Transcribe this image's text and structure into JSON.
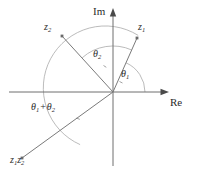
{
  "figure": {
    "background_color": "#ffffff",
    "axis_color": "#6f6f6f",
    "vector_color": "#7a7a7a",
    "arc_color": "#a9a9a9",
    "text_color": "#2b2b2b"
  },
  "axes": {
    "imaginary": {
      "label": "Im",
      "orientation": "vertical",
      "arrow": "up"
    },
    "real": {
      "label": "Re",
      "orientation": "horizontal",
      "arrow": "right"
    },
    "origin": {
      "x": 113,
      "y": 92
    }
  },
  "vectors": [
    {
      "id": "z1",
      "label_main": "z",
      "label_sub": "1",
      "tip": {
        "x": 137,
        "y": 38
      },
      "angle_degrees": 66,
      "label_pos": {
        "x": 139,
        "y": 24
      }
    },
    {
      "id": "z2",
      "label_main": "z",
      "label_sub": "2",
      "tip": {
        "x": 62,
        "y": 36
      },
      "angle_degrees": 132,
      "label_pos": {
        "x": 45,
        "y": 24
      }
    },
    {
      "id": "z1z2",
      "label_main": "z",
      "label_sub": "1",
      "label_main2": "z",
      "label_sub2": "2",
      "tip": {
        "x": 22,
        "y": 158
      },
      "angle_degrees": 238,
      "label_pos": {
        "x": 11,
        "y": 158
      }
    }
  ],
  "angles": [
    {
      "id": "theta1",
      "label_main": "θ",
      "label_sub": "1",
      "radius": 32,
      "from_degrees": 0,
      "to_degrees": 66,
      "label_pos": {
        "x": 122,
        "y": 70
      }
    },
    {
      "id": "theta2",
      "label_main": "θ",
      "label_sub": "2",
      "radius": 46,
      "from_degrees": 66,
      "to_degrees": 132,
      "label_pos": {
        "x": 93,
        "y": 50
      }
    },
    {
      "id": "theta1-plus-theta2",
      "label_main": "θ",
      "label_sub": "1",
      "plus": "+",
      "label_main2": "θ",
      "label_sub2": "2",
      "radius": 62,
      "from_degrees": 66,
      "to_degrees": 238,
      "label_pos": {
        "x": 31,
        "y": 103
      }
    }
  ]
}
